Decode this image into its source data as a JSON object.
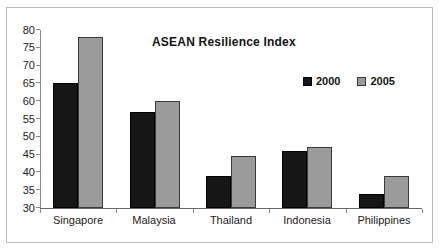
{
  "chart_data": {
    "type": "bar",
    "title": "ASEAN Resilience Index",
    "xlabel": "",
    "ylabel": "",
    "categories": [
      "Singapore",
      "Malaysia",
      "Thailand",
      "Indonesia",
      "Philippines"
    ],
    "series": [
      {
        "name": "2000",
        "color": "#161616",
        "values": [
          65,
          57,
          39,
          46,
          34
        ]
      },
      {
        "name": "2005",
        "color": "#9b9b9b",
        "values": [
          78,
          60,
          44.5,
          47,
          39
        ]
      }
    ],
    "ylim": [
      30,
      80
    ],
    "yticks": [
      30,
      35,
      40,
      45,
      50,
      55,
      60,
      65,
      70,
      75,
      80
    ],
    "grid": false,
    "legend_position": "upper-right-inside",
    "legend_entries": [
      "2000",
      "2005"
    ]
  }
}
